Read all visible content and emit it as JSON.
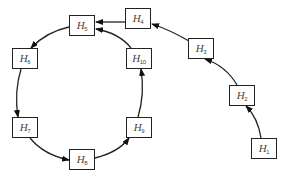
{
  "diagram": {
    "type": "directed-graph",
    "nodes": [
      {
        "id": "H1",
        "base": "H",
        "sub": "1",
        "x": 251,
        "y": 138
      },
      {
        "id": "H2",
        "base": "H",
        "sub": "2",
        "x": 229,
        "y": 85
      },
      {
        "id": "H3",
        "base": "H",
        "sub": "3",
        "x": 188,
        "y": 38
      },
      {
        "id": "H4",
        "base": "H",
        "sub": "4",
        "x": 125,
        "y": 8
      },
      {
        "id": "H5",
        "base": "H",
        "sub": "5",
        "x": 69,
        "y": 15
      },
      {
        "id": "H6",
        "base": "H",
        "sub": "6",
        "x": 12,
        "y": 48
      },
      {
        "id": "H7",
        "base": "H",
        "sub": "7",
        "x": 12,
        "y": 117
      },
      {
        "id": "H8",
        "base": "H",
        "sub": "8",
        "x": 69,
        "y": 149
      },
      {
        "id": "H9",
        "base": "H",
        "sub": "9",
        "x": 126,
        "y": 117
      },
      {
        "id": "H10",
        "base": "H",
        "sub": "10",
        "x": 126,
        "y": 48
      }
    ],
    "edges": [
      {
        "from": "H1",
        "to": "H2"
      },
      {
        "from": "H2",
        "to": "H3"
      },
      {
        "from": "H3",
        "to": "H4"
      },
      {
        "from": "H4",
        "to": "H5"
      },
      {
        "from": "H5",
        "to": "H6"
      },
      {
        "from": "H6",
        "to": "H7"
      },
      {
        "from": "H7",
        "to": "H8"
      },
      {
        "from": "H8",
        "to": "H9"
      },
      {
        "from": "H9",
        "to": "H10"
      },
      {
        "from": "H10",
        "to": "H5"
      }
    ],
    "colors": {
      "stroke": "#222222",
      "label": "#444444",
      "background": "#ffffff"
    }
  }
}
